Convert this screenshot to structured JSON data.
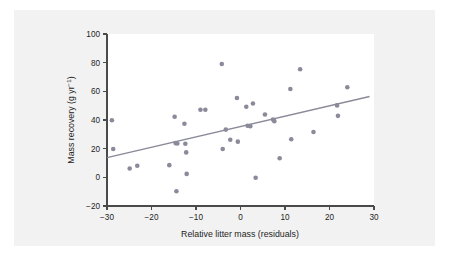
{
  "figure": {
    "background_color": "#f2f2f2",
    "plot_background_color": "#ffffff",
    "point_color": "#8a8a9a",
    "line_color": "#8a8a9a",
    "axis_color": "#4a4a4a"
  },
  "chart_data": {
    "type": "scatter",
    "title": "",
    "xlabel": "Relative litter mass (residuals)",
    "ylabel_main": "Mass recovery (g yr",
    "ylabel_sup": "−1",
    "ylabel_tail": ")",
    "ylabel_full": "Mass recovery (g yr−1)",
    "xlim": [
      -30,
      30
    ],
    "ylim": [
      -20,
      100
    ],
    "xticks": [
      -30,
      -20,
      -10,
      0,
      10,
      20,
      30
    ],
    "xticklabels": [
      "−30",
      "−20",
      "−10",
      "0",
      "10",
      "20",
      "30"
    ],
    "yticks": [
      -20,
      0,
      20,
      40,
      60,
      80,
      100
    ],
    "yticklabels": [
      "−20",
      "0",
      "20",
      "40",
      "60",
      "80",
      "100"
    ],
    "grid": false,
    "legend": null,
    "points": [
      {
        "x": -28.9,
        "y": 39.8
      },
      {
        "x": -28.6,
        "y": 19.8
      },
      {
        "x": -24.9,
        "y": 6.2
      },
      {
        "x": -23.2,
        "y": 8.1
      },
      {
        "x": -16.0,
        "y": 8.5
      },
      {
        "x": -14.8,
        "y": 42.3
      },
      {
        "x": -14.6,
        "y": 23.9
      },
      {
        "x": -14.2,
        "y": 23.6
      },
      {
        "x": -14.4,
        "y": -9.7
      },
      {
        "x": -12.6,
        "y": 37.4
      },
      {
        "x": -12.4,
        "y": 23.4
      },
      {
        "x": -12.2,
        "y": 17.4
      },
      {
        "x": -12.1,
        "y": 2.4
      },
      {
        "x": -9.0,
        "y": 47.1
      },
      {
        "x": -7.9,
        "y": 47.2
      },
      {
        "x": -4.2,
        "y": 79.1
      },
      {
        "x": -4.0,
        "y": 19.8
      },
      {
        "x": -3.3,
        "y": 33.3
      },
      {
        "x": -2.3,
        "y": 26.2
      },
      {
        "x": -0.8,
        "y": 55.3
      },
      {
        "x": -0.6,
        "y": 24.9
      },
      {
        "x": 1.3,
        "y": 49.2
      },
      {
        "x": 1.6,
        "y": 36.0
      },
      {
        "x": 2.2,
        "y": 35.7
      },
      {
        "x": 2.8,
        "y": 51.5
      },
      {
        "x": 3.4,
        "y": -0.3
      },
      {
        "x": 5.5,
        "y": 43.8
      },
      {
        "x": 7.3,
        "y": 40.4
      },
      {
        "x": 7.6,
        "y": 39.2
      },
      {
        "x": 8.8,
        "y": 13.3
      },
      {
        "x": 11.2,
        "y": 61.6
      },
      {
        "x": 11.4,
        "y": 26.6
      },
      {
        "x": 13.4,
        "y": 75.4
      },
      {
        "x": 16.4,
        "y": 31.6
      },
      {
        "x": 21.7,
        "y": 50.2
      },
      {
        "x": 21.9,
        "y": 42.9
      },
      {
        "x": 24.0,
        "y": 62.9
      }
    ],
    "trendline": {
      "x_start": -30,
      "y_start": 13.8,
      "x_end": 29,
      "y_end": 56.4
    }
  }
}
